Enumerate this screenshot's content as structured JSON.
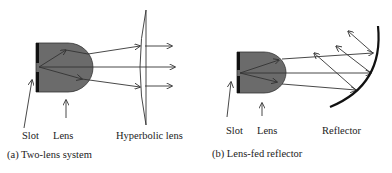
{
  "colors": {
    "lens_fill": "#6b6b6b",
    "lens_stroke": "#333333",
    "slot": "#111111",
    "ray": "#333333",
    "reflector": "#111111",
    "text": "#222222"
  },
  "panel_a": {
    "labels": {
      "slot": "Slot",
      "lens": "Lens",
      "hyperbolic_lens": "Hyperbolic lens"
    },
    "caption": "(a) Two-lens system"
  },
  "panel_b": {
    "labels": {
      "slot": "Slot",
      "lens": "Lens",
      "reflector": "Reflector"
    },
    "caption": "(b) Lens-fed reflector"
  }
}
